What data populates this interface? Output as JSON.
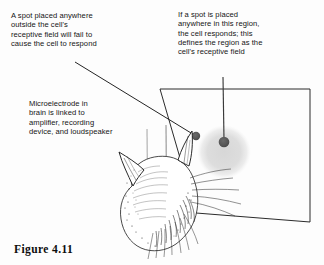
{
  "figure": {
    "number_label": "Figure 4.11",
    "background_color": "#fdfdfd",
    "ink_color": "#151515"
  },
  "annotations": {
    "outside_field": {
      "text": "A spot placed anywhere\noutside the cell's\nreceptive field will fail to\ncause the cell to respond",
      "lines": [
        "A spot placed anywhere",
        "outside the cell's",
        "receptive field will fail to",
        "cause the cell to respond"
      ]
    },
    "inside_field": {
      "text": "If a spot is placed\nanywhere in this region,\nthe cell responds; this\ndefines the region as the\ncell's receptive field",
      "lines": [
        "If a spot is placed",
        "anywhere in this region,",
        "the cell responds; this",
        "defines the region as the",
        "cell's receptive field"
      ]
    },
    "microelectrode": {
      "text": "Microelectrode in\nbrain is linked to\namplifier, recording\ndevice, and loudspeaker",
      "lines": [
        "Microelectrode in",
        "brain is linked to",
        "amplifier, recording",
        "device, and loudspeaker"
      ]
    }
  },
  "diagram": {
    "screen": {
      "name": "stimulus-screen",
      "corners": "160,89 310,89 310,222 196,213",
      "stroke": "#2b2b2b"
    },
    "receptive_field": {
      "name": "receptive-field-disc",
      "cx": 224,
      "cy": 152,
      "r": 26,
      "fill": "#dddddd"
    },
    "spot_outside": {
      "name": "spot-outside-field",
      "cx": 196,
      "cy": 136,
      "r": 4.2,
      "fill": "#5a5a5a"
    },
    "spot_inside": {
      "name": "spot-inside-field",
      "cx": 224,
      "cy": 142,
      "r": 5.2,
      "fill": "#5a5a5a"
    },
    "leader_outside": {
      "name": "leader-line-outside",
      "x1": 75,
      "y1": 62,
      "x2": 193,
      "y2": 134
    },
    "leader_inside": {
      "name": "leader-line-inside",
      "x1": 223,
      "y1": 77,
      "x2": 224,
      "y2": 140
    },
    "electrode_shaft_a": {
      "name": "electrode-shaft-left",
      "x1": 147,
      "y1": 130,
      "x2": 147,
      "y2": 177
    },
    "electrode_shaft_b": {
      "name": "electrode-shaft-right",
      "x1": 166,
      "y1": 126,
      "x2": 166,
      "y2": 182
    },
    "cat": {
      "name": "cat-head-illustration",
      "description": "rear view of a cat's head with two erect ears and whiskers"
    }
  }
}
